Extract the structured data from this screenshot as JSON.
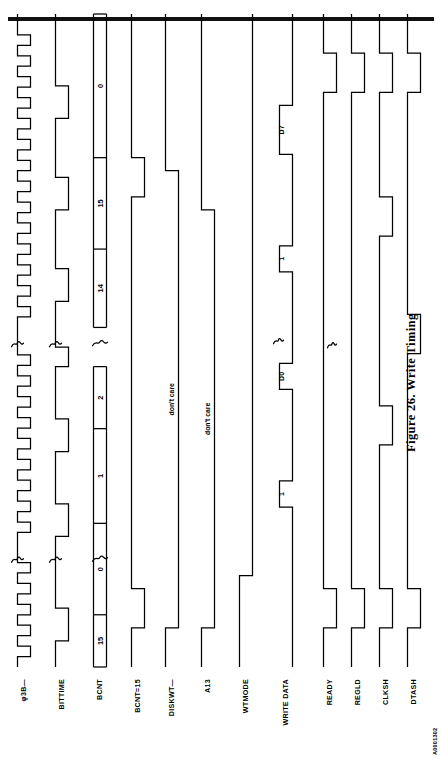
{
  "page": {
    "figure_caption": "Figure 26.  Write Timing",
    "figure_id": "A0001302",
    "rule_color": "#111111",
    "ink_color": "#000000",
    "background_color": "#ffffff",
    "orientation": "landscape-rotated-90-ccw"
  },
  "signals": [
    {
      "name": "phi3b",
      "label": "φ3B—"
    },
    {
      "name": "bittime",
      "label": "BITTIME"
    },
    {
      "name": "bcnt",
      "label": "BCNT"
    },
    {
      "name": "bcnt-eq-15",
      "label": "BCNT=15"
    },
    {
      "name": "diskwt",
      "label": "DISKWT—"
    },
    {
      "name": "a13",
      "label": "A13"
    },
    {
      "name": "wtmode",
      "label": "WTMODE"
    },
    {
      "name": "write-data",
      "label": "WRITE DATA"
    },
    {
      "name": "ready",
      "label": "READY"
    },
    {
      "name": "regld",
      "label": "REGLD"
    },
    {
      "name": "clksh",
      "label": "CLKSH"
    },
    {
      "name": "dtash",
      "label": "DTASH"
    }
  ],
  "chart_data": {
    "type": "timing",
    "title": "Figure 26.  Write Timing",
    "xlabel": "",
    "ylabel": "",
    "grid": false,
    "legend": "none",
    "time_axis": {
      "start": 0,
      "end": 100,
      "unit": "bit-time (relative)"
    },
    "break_marks": [
      {
        "at": 16.5,
        "style": "squiggle",
        "note": "time axis compressed"
      },
      {
        "at": 49.5,
        "style": "squiggle",
        "note": "time axis compressed"
      }
    ],
    "traces": [
      {
        "name": "phi3b",
        "label": "φ3B—",
        "kind": "clock",
        "description": "free-running clock, ~16 pulses shown, active-low pulses",
        "period": 5.0,
        "duty": 0.5,
        "edges": [
          {
            "t": 0,
            "v": 1
          },
          {
            "t": 1.6,
            "v": 0
          },
          {
            "t": 3.2,
            "v": 1
          },
          {
            "t": 4.8,
            "v": 0
          },
          {
            "t": 6.4,
            "v": 1
          },
          {
            "t": 8.0,
            "v": 0
          },
          {
            "t": 9.6,
            "v": 1
          },
          {
            "t": 11.2,
            "v": 0
          },
          {
            "t": 12.8,
            "v": 1
          },
          {
            "t": 14.4,
            "v": 0
          },
          {
            "t": 16.0,
            "v": 1
          },
          {
            "t": 19.0,
            "v": 1
          },
          {
            "t": 20.6,
            "v": 0
          },
          {
            "t": 22.2,
            "v": 1
          },
          {
            "t": 23.8,
            "v": 0
          },
          {
            "t": 25.4,
            "v": 1
          },
          {
            "t": 27.0,
            "v": 0
          },
          {
            "t": 28.6,
            "v": 1
          },
          {
            "t": 30.2,
            "v": 0
          },
          {
            "t": 31.8,
            "v": 1
          },
          {
            "t": 33.4,
            "v": 0
          },
          {
            "t": 35.0,
            "v": 1
          },
          {
            "t": 36.6,
            "v": 0
          },
          {
            "t": 38.2,
            "v": 1
          },
          {
            "t": 39.8,
            "v": 0
          },
          {
            "t": 41.4,
            "v": 1
          },
          {
            "t": 43.0,
            "v": 0
          },
          {
            "t": 44.6,
            "v": 1
          },
          {
            "t": 46.2,
            "v": 0
          },
          {
            "t": 47.8,
            "v": 1
          },
          {
            "t": 52.0,
            "v": 1
          },
          {
            "t": 53.6,
            "v": 0
          },
          {
            "t": 55.2,
            "v": 1
          },
          {
            "t": 56.8,
            "v": 0
          },
          {
            "t": 58.4,
            "v": 1
          },
          {
            "t": 60.0,
            "v": 0
          },
          {
            "t": 61.6,
            "v": 1
          },
          {
            "t": 63.2,
            "v": 0
          },
          {
            "t": 64.8,
            "v": 1
          },
          {
            "t": 66.4,
            "v": 0
          },
          {
            "t": 68.0,
            "v": 1
          },
          {
            "t": 69.6,
            "v": 0
          },
          {
            "t": 71.2,
            "v": 1
          },
          {
            "t": 72.8,
            "v": 0
          },
          {
            "t": 74.4,
            "v": 1
          },
          {
            "t": 76.0,
            "v": 0
          },
          {
            "t": 77.6,
            "v": 1
          },
          {
            "t": 79.2,
            "v": 0
          },
          {
            "t": 80.8,
            "v": 1
          },
          {
            "t": 82.4,
            "v": 0
          },
          {
            "t": 84.0,
            "v": 1
          },
          {
            "t": 85.6,
            "v": 0
          },
          {
            "t": 87.2,
            "v": 1
          },
          {
            "t": 88.8,
            "v": 0
          },
          {
            "t": 90.4,
            "v": 1
          },
          {
            "t": 92.0,
            "v": 0
          },
          {
            "t": 93.6,
            "v": 1
          },
          {
            "t": 95.2,
            "v": 0
          },
          {
            "t": 96.8,
            "v": 1
          },
          {
            "t": 100,
            "v": 1
          }
        ]
      },
      {
        "name": "bittime",
        "label": "BITTIME",
        "kind": "digital",
        "description": "bit-time strobe, one low pulse per bit cell",
        "edges": [
          {
            "t": 0,
            "v": 1
          },
          {
            "t": 4.0,
            "v": 0
          },
          {
            "t": 9.0,
            "v": 1
          },
          {
            "t": 16.5,
            "v": 1
          },
          {
            "t": 20.0,
            "v": 0
          },
          {
            "t": 25.0,
            "v": 1
          },
          {
            "t": 33.0,
            "v": 0
          },
          {
            "t": 38.0,
            "v": 1
          },
          {
            "t": 46.0,
            "v": 0
          },
          {
            "t": 49.0,
            "v": 1
          },
          {
            "t": 52.0,
            "v": 1
          },
          {
            "t": 56.0,
            "v": 0
          },
          {
            "t": 61.0,
            "v": 1
          },
          {
            "t": 70.0,
            "v": 0
          },
          {
            "t": 75.0,
            "v": 1
          },
          {
            "t": 84.0,
            "v": 0
          },
          {
            "t": 89.0,
            "v": 1
          },
          {
            "t": 100,
            "v": 1
          }
        ]
      },
      {
        "name": "bcnt",
        "label": "BCNT",
        "kind": "bus",
        "description": "bit counter value, increments each bit time, wraps 15->0",
        "cells": [
          {
            "value": "15",
            "t0": 0.0,
            "t1": 8.0
          },
          {
            "value": "0",
            "t0": 8.0,
            "t1": 22.0
          },
          {
            "value": "1",
            "t0": 22.0,
            "t1": 36.5
          },
          {
            "value": "2",
            "t0": 36.5,
            "t1": 46.0
          },
          {
            "value": "14",
            "t0": 52.0,
            "t1": 64.0
          },
          {
            "value": "15",
            "t0": 64.0,
            "t1": 78.0
          },
          {
            "value": "0",
            "t0": 78.0,
            "t1": 100.0
          }
        ]
      },
      {
        "name": "bcnt-eq-15",
        "label": "BCNT=15",
        "kind": "digital",
        "description": "decoded high while BCNT equals 15",
        "edges": [
          {
            "t": 0,
            "v": 1
          },
          {
            "t": 6.0,
            "v": 0
          },
          {
            "t": 12.0,
            "v": 1
          },
          {
            "t": 64.0,
            "v": 1
          },
          {
            "t": 72.0,
            "v": 0
          },
          {
            "t": 78.0,
            "v": 1
          },
          {
            "t": 100,
            "v": 1
          }
        ]
      },
      {
        "name": "diskwt",
        "label": "DISKWT—",
        "kind": "digital",
        "annotation": "don't care",
        "description": "disk write command, asserted low for the write window; level undefined outside",
        "edges": [
          {
            "t": 0,
            "v": 1
          },
          {
            "t": 6.0,
            "v": 0
          },
          {
            "t": 12.0,
            "v": 0
          },
          {
            "t": 70.0,
            "v": 0
          },
          {
            "t": 76.0,
            "v": 1
          },
          {
            "t": 100,
            "v": 1
          }
        ]
      },
      {
        "name": "a13",
        "label": "A13",
        "kind": "digital",
        "annotation": "don't care",
        "description": "address bit 13 qualifier; level undefined outside the window",
        "edges": [
          {
            "t": 0,
            "v": 1
          },
          {
            "t": 6.0,
            "v": 0
          },
          {
            "t": 12.0,
            "v": 0
          },
          {
            "t": 64.0,
            "v": 0
          },
          {
            "t": 70.0,
            "v": 1
          },
          {
            "t": 100,
            "v": 1
          }
        ]
      },
      {
        "name": "wtmode",
        "label": "WTMODE",
        "kind": "digital",
        "description": "write-mode latch, goes low at start of write and stays low",
        "edges": [
          {
            "t": 0,
            "v": 1
          },
          {
            "t": 14.0,
            "v": 0
          },
          {
            "t": 100,
            "v": 0
          }
        ]
      },
      {
        "name": "write-data",
        "label": "WRITE DATA",
        "kind": "digital",
        "description": "serial write-data stream, one pulse per data bit",
        "pulse_labels": [
          "1",
          "D0",
          "1",
          "D7"
        ],
        "edges": [
          {
            "t": 0,
            "v": 0
          },
          {
            "t": 22.0,
            "v": 0
          },
          {
            "t": 24.5,
            "v": 1
          },
          {
            "t": 28.5,
            "v": 0
          },
          {
            "t": 40.0,
            "v": 0
          },
          {
            "t": 42.5,
            "v": 1
          },
          {
            "t": 46.5,
            "v": 0
          },
          {
            "t": 58.0,
            "v": 0
          },
          {
            "t": 60.5,
            "v": 1
          },
          {
            "t": 64.5,
            "v": 0
          },
          {
            "t": 76.0,
            "v": 0
          },
          {
            "t": 78.5,
            "v": 1
          },
          {
            "t": 86.0,
            "v": 0
          },
          {
            "t": 100,
            "v": 0
          }
        ]
      },
      {
        "name": "ready",
        "label": "READY",
        "kind": "digital",
        "description": "ready handshake, low pulse once per byte transfer",
        "edges": [
          {
            "t": 0,
            "v": 1
          },
          {
            "t": 6.0,
            "v": 0
          },
          {
            "t": 12.0,
            "v": 1
          },
          {
            "t": 84.0,
            "v": 1
          },
          {
            "t": 88.0,
            "v": 0
          },
          {
            "t": 94.0,
            "v": 1
          },
          {
            "t": 100,
            "v": 1
          }
        ]
      },
      {
        "name": "regld",
        "label": "REGLD",
        "kind": "digital",
        "description": "register load strobe, low pulse at each byte load",
        "edges": [
          {
            "t": 0,
            "v": 1
          },
          {
            "t": 6.0,
            "v": 0
          },
          {
            "t": 12.0,
            "v": 1
          },
          {
            "t": 84.0,
            "v": 1
          },
          {
            "t": 88.0,
            "v": 0
          },
          {
            "t": 94.0,
            "v": 1
          },
          {
            "t": 100,
            "v": 1
          }
        ]
      },
      {
        "name": "clksh",
        "label": "CLKSH",
        "kind": "digital",
        "description": "shift clock, low pulse per shifted bit",
        "edges": [
          {
            "t": 0,
            "v": 1
          },
          {
            "t": 6.0,
            "v": 0
          },
          {
            "t": 12.0,
            "v": 1
          },
          {
            "t": 30.0,
            "v": 1
          },
          {
            "t": 34.0,
            "v": 0
          },
          {
            "t": 40.0,
            "v": 1
          },
          {
            "t": 62.0,
            "v": 1
          },
          {
            "t": 66.0,
            "v": 0
          },
          {
            "t": 72.0,
            "v": 1
          },
          {
            "t": 84.0,
            "v": 1
          },
          {
            "t": 88.0,
            "v": 0
          },
          {
            "t": 94.0,
            "v": 1
          },
          {
            "t": 100,
            "v": 1
          }
        ]
      },
      {
        "name": "dtash",
        "label": "DTASH",
        "kind": "digital",
        "description": "data shift enable, wide low intervals during shifting",
        "edges": [
          {
            "t": 0,
            "v": 1
          },
          {
            "t": 6.0,
            "v": 0
          },
          {
            "t": 12.0,
            "v": 1
          },
          {
            "t": 42.0,
            "v": 1
          },
          {
            "t": 48.0,
            "v": 0
          },
          {
            "t": 54.0,
            "v": 1
          },
          {
            "t": 84.0,
            "v": 1
          },
          {
            "t": 88.0,
            "v": 0
          },
          {
            "t": 94.0,
            "v": 1
          },
          {
            "t": 100,
            "v": 1
          }
        ]
      }
    ]
  }
}
